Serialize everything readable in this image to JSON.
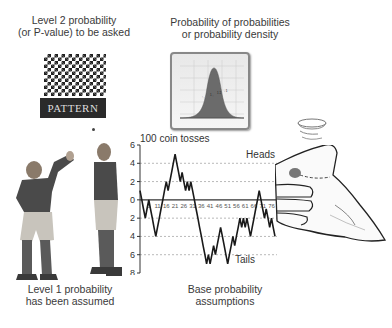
{
  "labels": {
    "level2": "Level 2 probability\n(or P-value) to be asked",
    "density": "Probability of probabilities\nor probability density",
    "level1": "Level 1 probability\nhas been assumed",
    "base": "Base probability\nassumptions"
  },
  "pattern": {
    "label": "PATTERN"
  },
  "chart_data": {
    "type": "line",
    "title": "100 coin tosses",
    "annotations": [
      "Heads",
      "Tails"
    ],
    "yticks": [
      6,
      4,
      2,
      0,
      2,
      4,
      6,
      8
    ],
    "ytick_values": [
      6,
      4,
      2,
      0,
      -2,
      -4,
      -6,
      -8
    ],
    "ylim": [
      -8,
      6
    ],
    "xticks": [
      "6",
      "11",
      "16",
      "21",
      "26",
      "31",
      "36",
      "41",
      "46",
      "51",
      "56",
      "61",
      "66",
      "71",
      "76"
    ],
    "xlim": [
      1,
      78
    ],
    "gridlines": [
      4,
      2,
      -2,
      -4,
      -6
    ],
    "x": [
      1,
      2,
      3,
      4,
      5,
      6,
      7,
      8,
      9,
      10,
      11,
      12,
      13,
      14,
      15,
      16,
      17,
      18,
      19,
      20,
      21,
      22,
      23,
      24,
      25,
      26,
      27,
      28,
      29,
      30,
      31,
      32,
      33,
      34,
      35,
      36,
      37,
      38,
      39,
      40,
      41,
      42,
      43,
      44,
      45,
      46,
      47,
      48,
      49,
      50,
      51,
      52,
      53,
      54,
      55,
      56,
      57,
      58,
      59,
      60,
      61,
      62,
      63,
      64,
      65,
      66,
      67,
      68,
      69,
      70,
      71,
      72,
      73,
      74,
      75,
      76,
      77,
      78
    ],
    "values": [
      1,
      0,
      -1,
      -2,
      -1,
      0,
      -1,
      -2,
      -3,
      -4,
      -3,
      -2,
      -1,
      0,
      1,
      2,
      1,
      2,
      3,
      4,
      5,
      4,
      3,
      2,
      3,
      2,
      1,
      2,
      1,
      2,
      1,
      0,
      -1,
      -2,
      -3,
      -4,
      -5,
      -6,
      -7,
      -6,
      -7,
      -6,
      -5,
      -6,
      -5,
      -4,
      -3,
      -4,
      -5,
      -6,
      -7,
      -6,
      -5,
      -4,
      -5,
      -4,
      -3,
      -2,
      -3,
      -2,
      -3,
      -2,
      -3,
      -4,
      -3,
      -2,
      -1,
      0,
      1,
      0,
      -1,
      -2,
      -1,
      -2,
      -3,
      -2,
      -3,
      -4
    ],
    "density_inset": {
      "type": "area",
      "description": "bell-shaped normal distribution curve",
      "xticks": [
        "-4",
        "-2",
        "0",
        "2",
        "4"
      ]
    }
  }
}
